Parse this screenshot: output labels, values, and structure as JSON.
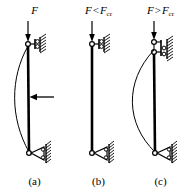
{
  "figure": {
    "background": "#ffffff",
    "ink": "#000000",
    "width": 196,
    "height": 191
  },
  "panels": [
    {
      "id": "a",
      "caption": "(a)",
      "load_symbol": "F",
      "load_relation": "",
      "load_critical_symbol": "",
      "load_critical_subscript": "",
      "state": "column with lateral disturbing force",
      "column_shape": "slightly bowed left",
      "top_support": "roller-on-wall",
      "bottom_support": "pin-on-hatched-ground",
      "lateral_arrow": "true",
      "lateral_arrow_direction": "left",
      "deflection_px": 14
    },
    {
      "id": "b",
      "caption": "(b)",
      "load_symbol": "F",
      "load_relation": "<",
      "load_critical_symbol": "F",
      "load_critical_subscript": "cr",
      "state": "stable, column remains straight",
      "column_shape": "straight",
      "top_support": "roller-on-wall",
      "bottom_support": "pin-on-hatched-ground",
      "lateral_arrow": "false",
      "lateral_arrow_direction": "",
      "deflection_px": 0
    },
    {
      "id": "c",
      "caption": "(c)",
      "load_symbol": "F",
      "load_relation": ">",
      "load_critical_symbol": "F",
      "load_critical_subscript": "cr",
      "state": "unstable, column buckles",
      "column_shape": "strongly bowed left",
      "top_support": "roller-on-wall-displaced",
      "bottom_support": "pin-on-hatched-ground",
      "lateral_arrow": "false",
      "lateral_arrow_direction": "",
      "deflection_px": 32
    }
  ]
}
